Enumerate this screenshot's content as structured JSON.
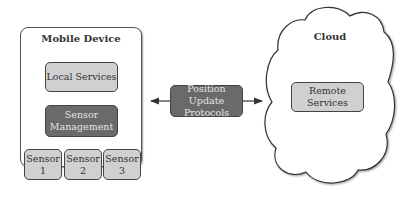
{
  "mobile_device": {
    "title": "Mobile Device",
    "local_services": "Local Services",
    "sensor_management": [
      "Sensor",
      "Management"
    ],
    "sensors": [
      {
        "line1": "Sensor",
        "line2": "1"
      },
      {
        "line1": "Sensor",
        "line2": "2"
      },
      {
        "line1": "Sensor",
        "line2": "3"
      }
    ]
  },
  "protocol": {
    "line1": "Position Update",
    "line2": "Protocols"
  },
  "cloud": {
    "title": "Cloud",
    "remote_services": [
      "Remote",
      "Services"
    ]
  },
  "colors": {
    "light_box": "#d0d0d0",
    "dark_box": "#6a6a6a",
    "border": "#444444"
  }
}
